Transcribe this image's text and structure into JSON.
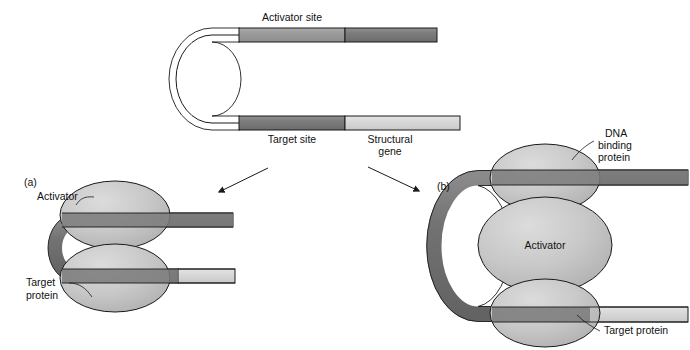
{
  "figure": {
    "background_color": "#ffffff",
    "width": 690,
    "height": 350
  },
  "colors": {
    "dna_dark": "#6e6e6e",
    "dna_mid": "#7d7d7d",
    "dna_light": "#d6d6d6",
    "activator_site": "#9a9a9a",
    "protein_fill_light": "#c9c9c9",
    "protein_fill_mid": "#b8b8b8",
    "outline": "#1a1a1a",
    "text": "#111111"
  },
  "top_diagram": {
    "name": "dna-loop-overview",
    "labels": {
      "activator_site": "Activator site",
      "target_site": "Target site",
      "structural_gene_line1": "Structural",
      "structural_gene_line2": "gene"
    },
    "segments": [
      {
        "id": "upper-bend",
        "label": "",
        "shade": "dna_dark"
      },
      {
        "id": "activator-site",
        "label": "Activator site",
        "shade": "activator_site"
      },
      {
        "id": "upper-right",
        "label": "",
        "shade": "dna_mid"
      },
      {
        "id": "target-site",
        "label": "Target site",
        "shade": "dna_mid"
      },
      {
        "id": "structural-gene",
        "label": "Structural gene",
        "shade": "dna_light"
      }
    ]
  },
  "arrows": {
    "left": {
      "name": "arrow-to-panel-a",
      "direction": "down-left"
    },
    "right": {
      "name": "arrow-to-panel-b",
      "direction": "down-right"
    }
  },
  "panel_a": {
    "tag": "(a)",
    "labels": {
      "activator": "Activator",
      "target_protein_line1": "Target",
      "target_protein_line2": "protein"
    },
    "shapes": [
      {
        "id": "activator-blob",
        "label": "Activator"
      },
      {
        "id": "target-protein-blob",
        "label": "Target protein"
      }
    ]
  },
  "panel_b": {
    "tag": "(b)",
    "labels": {
      "dna_binding_protein_line1": "DNA",
      "dna_binding_protein_line2": "binding",
      "dna_binding_protein_line3": "protein",
      "activator": "Activator",
      "target_protein": "Target  protein"
    },
    "shapes": [
      {
        "id": "dna-binding-protein-blob",
        "label": "DNA binding protein"
      },
      {
        "id": "activator-blob",
        "label": "Activator"
      },
      {
        "id": "target-protein-blob",
        "label": "Target protein"
      }
    ]
  }
}
